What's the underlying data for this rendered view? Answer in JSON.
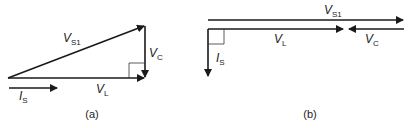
{
  "diagram": {
    "panels": [
      {
        "id": "a",
        "caption": "(a)",
        "vectors": [
          {
            "name": "V_S1",
            "symbol": "V",
            "subscript": "S1",
            "from": [
              8,
              78
            ],
            "to": [
              145,
              26
            ]
          },
          {
            "name": "V_C",
            "symbol": "V",
            "subscript": "C",
            "from": [
              145,
              26
            ],
            "to": [
              145,
              78
            ]
          },
          {
            "name": "V_L",
            "symbol": "V",
            "subscript": "L",
            "from": [
              8,
              78
            ],
            "to": [
              145,
              78
            ]
          },
          {
            "name": "I_S",
            "symbol": "I",
            "subscript": "S",
            "from": [
              8,
              88
            ],
            "to": [
              58,
              88
            ]
          }
        ],
        "right_angle_marker": "at junction of V_L and V_C"
      },
      {
        "id": "b",
        "caption": "(b)",
        "vectors": [
          {
            "name": "V_S1",
            "symbol": "V",
            "subscript": "S1",
            "from": [
              208,
              20
            ],
            "to": [
              404,
              20
            ]
          },
          {
            "name": "V_L",
            "symbol": "V",
            "subscript": "L",
            "from": [
              208,
              29
            ],
            "to": [
              344,
              29
            ]
          },
          {
            "name": "V_C",
            "symbol": "V",
            "subscript": "C",
            "from": [
              404,
              29
            ],
            "to": [
              348,
              29
            ]
          },
          {
            "name": "I_S",
            "symbol": "I",
            "subscript": "S",
            "from": [
              208,
              29
            ],
            "to": [
              208,
              77
            ]
          }
        ],
        "right_angle_marker": "at junction of V_L and I_S"
      }
    ],
    "labels": {
      "a_vs1": {
        "sym": "V",
        "sub": "S1"
      },
      "a_vc": {
        "sym": "V",
        "sub": "C"
      },
      "a_vl": {
        "sym": "V",
        "sub": "L"
      },
      "a_is": {
        "sym": "I",
        "sub": "S"
      },
      "b_vs1": {
        "sym": "V",
        "sub": "S1"
      },
      "b_vl": {
        "sym": "V",
        "sub": "L"
      },
      "b_vc": {
        "sym": "V",
        "sub": "C"
      },
      "b_is": {
        "sym": "I",
        "sub": "S"
      },
      "caption_a": "(a)",
      "caption_b": "(b)"
    }
  }
}
